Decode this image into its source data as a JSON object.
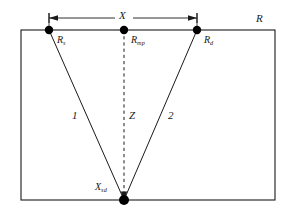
{
  "figure": {
    "type": "geometry-diagram",
    "background_color": "#ffffff",
    "line_color": "#1a1a1a",
    "node_color": "#000000"
  },
  "labels": {
    "source": {
      "base": "R",
      "sub": "s"
    },
    "midpoint": {
      "base": "R",
      "sub": "mp"
    },
    "detector": {
      "base": "R",
      "sub": "d"
    },
    "region": {
      "base": "R",
      "sub": ""
    },
    "separation": {
      "base": "X",
      "sub": ""
    },
    "depth": {
      "base": "Z",
      "sub": ""
    },
    "path_one": {
      "base": "1",
      "sub": ""
    },
    "path_two": {
      "base": "2",
      "sub": ""
    },
    "vertex": {
      "base": "X",
      "sub": "sd"
    }
  },
  "geometry": {
    "rect": {
      "x": 21,
      "y": 30,
      "width": 254,
      "height": 170
    },
    "nodes": [
      {
        "name": "source",
        "x": 49,
        "y": 30,
        "r": 4.2
      },
      {
        "name": "midpoint",
        "x": 124,
        "y": 30,
        "r": 4.2
      },
      {
        "name": "detector",
        "x": 197,
        "y": 30,
        "r": 4.2
      },
      {
        "name": "vertex",
        "x": 124,
        "y": 200,
        "r": 5.0
      }
    ],
    "paths": [
      {
        "name": "path-one",
        "x1": 49,
        "y1": 30,
        "x2": 124,
        "y2": 200,
        "style": "solid"
      },
      {
        "name": "path-two",
        "x1": 197,
        "y1": 30,
        "x2": 124,
        "y2": 200,
        "style": "solid"
      },
      {
        "name": "depth-axis",
        "x1": 124,
        "y1": 30,
        "x2": 124,
        "y2": 200,
        "style": "dashed"
      }
    ],
    "dimension": {
      "name": "separation-dimension",
      "y": 18,
      "x_left": 49,
      "x_right": 197,
      "tick_half_height": 5,
      "extension_bottom": 30
    }
  }
}
